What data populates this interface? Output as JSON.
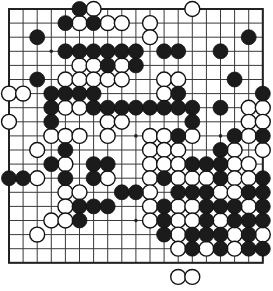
{
  "app": {
    "title": "Go Board Position",
    "board_size": 19,
    "background_color": "#ffffff",
    "line_color": "#3a3a3a",
    "border_color": "#222222",
    "black_stone_color": "#1b1b1b",
    "white_stone_color": "#ffffff"
  },
  "board": {
    "origin_x": 9,
    "origin_y": 9,
    "spacing": 14.1,
    "star_points": [
      [
        3,
        3
      ],
      [
        9,
        3
      ],
      [
        15,
        3
      ],
      [
        3,
        9
      ],
      [
        9,
        9
      ],
      [
        15,
        9
      ],
      [
        3,
        15
      ],
      [
        9,
        15
      ],
      [
        15,
        15
      ]
    ]
  },
  "stones": {
    "black": [
      [
        5,
        0
      ],
      [
        4,
        1
      ],
      [
        6,
        1
      ],
      [
        2,
        2
      ],
      [
        17,
        2
      ],
      [
        4,
        3
      ],
      [
        5,
        3
      ],
      [
        6,
        3
      ],
      [
        7,
        3
      ],
      [
        8,
        3
      ],
      [
        9,
        3
      ],
      [
        11,
        3
      ],
      [
        12,
        3
      ],
      [
        15,
        3
      ],
      [
        7,
        4
      ],
      [
        9,
        4
      ],
      [
        2,
        5
      ],
      [
        16,
        5
      ],
      [
        3,
        6
      ],
      [
        4,
        6
      ],
      [
        5,
        6
      ],
      [
        6,
        6
      ],
      [
        12,
        6
      ],
      [
        18,
        6
      ],
      [
        3,
        7
      ],
      [
        6,
        7
      ],
      [
        7,
        7
      ],
      [
        8,
        7
      ],
      [
        9,
        7
      ],
      [
        10,
        7
      ],
      [
        11,
        7
      ],
      [
        12,
        7
      ],
      [
        13,
        7
      ],
      [
        15,
        7
      ],
      [
        3,
        8
      ],
      [
        13,
        8
      ],
      [
        12,
        9
      ],
      [
        16,
        9
      ],
      [
        18,
        9
      ],
      [
        4,
        10
      ],
      [
        15,
        10
      ],
      [
        3,
        11
      ],
      [
        6,
        11
      ],
      [
        7,
        11
      ],
      [
        13,
        11
      ],
      [
        14,
        11
      ],
      [
        15,
        11
      ],
      [
        0,
        12
      ],
      [
        1,
        12
      ],
      [
        4,
        12
      ],
      [
        6,
        12
      ],
      [
        11,
        12
      ],
      [
        15,
        12
      ],
      [
        18,
        12
      ],
      [
        8,
        13
      ],
      [
        9,
        13
      ],
      [
        12,
        13
      ],
      [
        13,
        13
      ],
      [
        14,
        13
      ],
      [
        17,
        13
      ],
      [
        18,
        13
      ],
      [
        5,
        14
      ],
      [
        6,
        14
      ],
      [
        7,
        14
      ],
      [
        11,
        14
      ],
      [
        14,
        14
      ],
      [
        15,
        14
      ],
      [
        16,
        14
      ],
      [
        18,
        14
      ],
      [
        5,
        15
      ],
      [
        11,
        15
      ],
      [
        14,
        15
      ],
      [
        16,
        15
      ],
      [
        17,
        15
      ],
      [
        18,
        15
      ],
      [
        11,
        16
      ],
      [
        13,
        16
      ],
      [
        14,
        16
      ],
      [
        15,
        16
      ],
      [
        17,
        16
      ],
      [
        13,
        17
      ],
      [
        15,
        17
      ],
      [
        17,
        17
      ],
      [
        18,
        17
      ]
    ],
    "white": [
      [
        6,
        0
      ],
      [
        13,
        0
      ],
      [
        5,
        1
      ],
      [
        7,
        1
      ],
      [
        8,
        1
      ],
      [
        10,
        1
      ],
      [
        10,
        2
      ],
      [
        5,
        4
      ],
      [
        6,
        4
      ],
      [
        8,
        4
      ],
      [
        4,
        5
      ],
      [
        5,
        5
      ],
      [
        6,
        5
      ],
      [
        7,
        5
      ],
      [
        8,
        5
      ],
      [
        11,
        5
      ],
      [
        12,
        5
      ],
      [
        0,
        6
      ],
      [
        1,
        6
      ],
      [
        11,
        6
      ],
      [
        4,
        7
      ],
      [
        5,
        7
      ],
      [
        17,
        7
      ],
      [
        18,
        7
      ],
      [
        0,
        8
      ],
      [
        7,
        8
      ],
      [
        8,
        8
      ],
      [
        17,
        8
      ],
      [
        18,
        8
      ],
      [
        3,
        9
      ],
      [
        4,
        9
      ],
      [
        5,
        9
      ],
      [
        7,
        9
      ],
      [
        10,
        9
      ],
      [
        11,
        9
      ],
      [
        13,
        9
      ],
      [
        17,
        9
      ],
      [
        2,
        10
      ],
      [
        10,
        10
      ],
      [
        11,
        10
      ],
      [
        12,
        10
      ],
      [
        16,
        10
      ],
      [
        18,
        10
      ],
      [
        4,
        11
      ],
      [
        10,
        11
      ],
      [
        11,
        11
      ],
      [
        12,
        11
      ],
      [
        16,
        11
      ],
      [
        17,
        11
      ],
      [
        2,
        12
      ],
      [
        7,
        12
      ],
      [
        10,
        12
      ],
      [
        12,
        12
      ],
      [
        13,
        12
      ],
      [
        14,
        12
      ],
      [
        16,
        12
      ],
      [
        17,
        12
      ],
      [
        4,
        13
      ],
      [
        5,
        13
      ],
      [
        10,
        13
      ],
      [
        15,
        13
      ],
      [
        16,
        13
      ],
      [
        4,
        14
      ],
      [
        10,
        14
      ],
      [
        12,
        14
      ],
      [
        13,
        14
      ],
      [
        17,
        14
      ],
      [
        3,
        15
      ],
      [
        4,
        15
      ],
      [
        10,
        15
      ],
      [
        12,
        15
      ],
      [
        13,
        15
      ],
      [
        15,
        15
      ],
      [
        2,
        16
      ],
      [
        12,
        16
      ],
      [
        16,
        16
      ],
      [
        18,
        16
      ],
      [
        12,
        17
      ],
      [
        14,
        17
      ],
      [
        16,
        17
      ]
    ],
    "captured_below_board": [
      [
        12,
        19
      ],
      [
        13,
        19
      ]
    ]
  }
}
